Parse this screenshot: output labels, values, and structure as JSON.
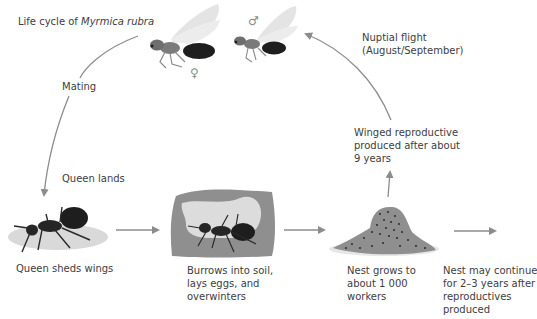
{
  "title": {
    "prefix": "Life cycle of ",
    "species": "Myrmica rubra"
  },
  "symbols": {
    "female": "♀",
    "male": "♂"
  },
  "labels": {
    "mating": "Mating",
    "queen_lands": "Queen lands",
    "nuptial_flight_line1": "Nuptial flight",
    "nuptial_flight_line2": "(August/September)",
    "winged_line1": "Winged reproductive",
    "winged_line2": "produced after about",
    "winged_line3": "9 years"
  },
  "stages": [
    {
      "id": "queen-sheds-wings",
      "lines": [
        "Queen sheds wings"
      ]
    },
    {
      "id": "burrows",
      "lines": [
        "Burrows into soil,",
        "lays eggs, and",
        "overwinters"
      ]
    },
    {
      "id": "nest-grows",
      "lines": [
        "Nest grows to",
        "about 1 000",
        "workers"
      ]
    },
    {
      "id": "nest-continues",
      "lines": [
        "Nest may continue",
        "for 2–3 years after",
        "reproductives",
        "produced"
      ]
    }
  ],
  "colors": {
    "arrow": "#8c8c8c",
    "soil": "#8f8f8f",
    "chamber": "#dcdcdc",
    "ground": "#d9d9d9",
    "ant_body": "#1e1e1e",
    "thorax": "#7a7a7a",
    "wing": "#e4e4e4"
  }
}
